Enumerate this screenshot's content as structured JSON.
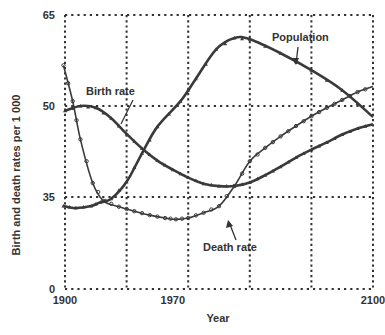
{
  "chart_data": {
    "type": "line",
    "title": "",
    "xlabel": "Year",
    "ylabel": "Birth and death rates per 1 000",
    "xlim": [
      1900,
      2100
    ],
    "x_tick_labels": [
      "1900",
      "1970",
      "2100"
    ],
    "x_tick_values": [
      1900,
      1970,
      2100
    ],
    "x_gridlines": [
      1900,
      1940,
      1980,
      2020,
      2060,
      2100
    ],
    "y_tick_labels": [
      "0",
      "35",
      "50",
      "65"
    ],
    "y_tick_values": [
      0,
      35,
      50,
      65
    ],
    "grid": true,
    "grid_style": "dotted",
    "legend": "none (inline annotations)",
    "series": [
      {
        "name": "Birth rate",
        "marker": "small triangles",
        "points": [
          [
            1900,
            49.2
          ],
          [
            1910,
            50.0
          ],
          [
            1920,
            49.7
          ],
          [
            1930,
            48.0
          ],
          [
            1940,
            45.4
          ],
          [
            1950,
            43.0
          ],
          [
            1960,
            41.0
          ],
          [
            1970,
            39.5
          ],
          [
            1980,
            38.2
          ],
          [
            1990,
            37.2
          ],
          [
            2000,
            36.8
          ],
          [
            2010,
            36.8
          ],
          [
            2020,
            37.4
          ],
          [
            2030,
            38.6
          ],
          [
            2040,
            40.0
          ],
          [
            2050,
            41.5
          ],
          [
            2060,
            42.8
          ],
          [
            2070,
            44.0
          ],
          [
            2080,
            45.3
          ],
          [
            2090,
            46.3
          ],
          [
            2100,
            47.0
          ]
        ]
      },
      {
        "name": "Death rate",
        "marker": "small circles",
        "points": [
          [
            1899,
            56.7
          ],
          [
            1905,
            50.8
          ],
          [
            1910,
            44.5
          ],
          [
            1918,
            37.3
          ],
          [
            1925,
            33.5
          ],
          [
            1935,
            31.3
          ],
          [
            1945,
            29.6
          ],
          [
            1955,
            28.1
          ],
          [
            1965,
            27.0
          ],
          [
            1972,
            26.5
          ],
          [
            1980,
            27.0
          ],
          [
            1990,
            29.0
          ],
          [
            2000,
            31.5
          ],
          [
            2010,
            36.8
          ],
          [
            2020,
            40.9
          ],
          [
            2030,
            43.1
          ],
          [
            2040,
            45.0
          ],
          [
            2050,
            46.7
          ],
          [
            2060,
            48.3
          ],
          [
            2070,
            49.7
          ],
          [
            2080,
            51.0
          ],
          [
            2090,
            52.3
          ],
          [
            2100,
            53.2
          ]
        ]
      },
      {
        "name": "Population",
        "marker": "small triangles",
        "points": [
          [
            1899,
            31.6
          ],
          [
            1907,
            30.8
          ],
          [
            1917,
            31.6
          ],
          [
            1923,
            33.0
          ],
          [
            1930,
            34.3
          ],
          [
            1940,
            37.5
          ],
          [
            1950,
            42.2
          ],
          [
            1960,
            46.6
          ],
          [
            1975,
            50.8
          ],
          [
            1985,
            54.5
          ],
          [
            1998,
            59.3
          ],
          [
            2010,
            61.2
          ],
          [
            2020,
            61.0
          ],
          [
            2040,
            58.7
          ],
          [
            2060,
            55.9
          ],
          [
            2080,
            52.6
          ],
          [
            2100,
            48.2
          ]
        ]
      }
    ],
    "annotations": [
      {
        "text": "Birth rate",
        "points_to": "Birth rate"
      },
      {
        "text": "Population",
        "points_to": "Population"
      },
      {
        "text": "Death rate",
        "points_to": "Death rate"
      }
    ]
  },
  "labels": {
    "xlabel": "Year",
    "ylabel": "Birth and death rates per 1 000",
    "annot_birth": "Birth rate",
    "annot_population": "Population",
    "annot_death": "Death rate"
  },
  "style": {
    "line_color": "#3a3a3a",
    "grid_color": "#333333"
  }
}
